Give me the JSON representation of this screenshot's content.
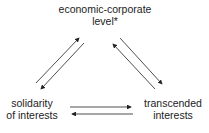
{
  "nodes": {
    "top": {
      "line1": "economic-corporate",
      "line2": "level*"
    },
    "left": {
      "line1": "solidarity",
      "line2": "of interests"
    },
    "right": {
      "line1": "transcended",
      "line2": "interests"
    }
  },
  "edges": [
    {
      "from": "left",
      "to": "top"
    },
    {
      "from": "top",
      "to": "left"
    },
    {
      "from": "top",
      "to": "right"
    },
    {
      "from": "right",
      "to": "top"
    },
    {
      "from": "left",
      "to": "right"
    },
    {
      "from": "right",
      "to": "left"
    }
  ]
}
